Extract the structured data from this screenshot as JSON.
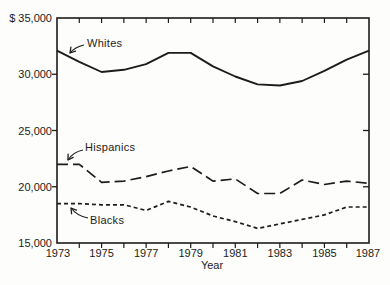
{
  "figure": {
    "background": "#fdfdfb",
    "ink": "#1c1c1c"
  },
  "chart_data": {
    "type": "line",
    "title": "",
    "xlabel": "Year",
    "ylabel": "",
    "currency_prefix": "$",
    "xlim": [
      1973,
      1987
    ],
    "ylim": [
      15000,
      35000
    ],
    "grid": false,
    "legend_position": "inline-labels",
    "x": [
      1973,
      1974,
      1975,
      1976,
      1977,
      1978,
      1979,
      1980,
      1981,
      1982,
      1983,
      1984,
      1985,
      1986,
      1987
    ],
    "x_tick_labels": [
      "1973",
      "1975",
      "1977",
      "1979",
      "1981",
      "1983",
      "1985",
      "1987"
    ],
    "x_minor_ticks": [
      1974,
      1975,
      1976,
      1977,
      1978,
      1979,
      1980,
      1981,
      1982,
      1983,
      1984,
      1985,
      1986
    ],
    "y_ticks": [
      {
        "value": 35000,
        "label": "$ 35,000"
      },
      {
        "value": 30000,
        "label": "30,000"
      },
      {
        "value": 25000,
        "label": "25,000"
      },
      {
        "value": 20000,
        "label": "20,000"
      },
      {
        "value": 15000,
        "label": "15,000"
      }
    ],
    "series": [
      {
        "name": "Whites",
        "line_style": "solid",
        "values": [
          32100,
          31100,
          30200,
          30400,
          30900,
          31900,
          31900,
          30700,
          29800,
          29100,
          29000,
          29400,
          30300,
          31300,
          32100
        ]
      },
      {
        "name": "Hispanics",
        "line_style": "long-dash",
        "values": [
          22000,
          22000,
          20400,
          20500,
          20900,
          21400,
          21800,
          20500,
          20700,
          19400,
          19400,
          20600,
          20200,
          20500,
          20300
        ]
      },
      {
        "name": "Blacks",
        "line_style": "short-dash",
        "values": [
          18500,
          18500,
          18400,
          18400,
          17900,
          18700,
          18200,
          17400,
          16900,
          16300,
          16700,
          17100,
          17500,
          18200,
          18200
        ]
      }
    ],
    "annotations": [
      {
        "text": "Whites"
      },
      {
        "text": "Hispanics"
      },
      {
        "text": "Blacks"
      }
    ]
  }
}
